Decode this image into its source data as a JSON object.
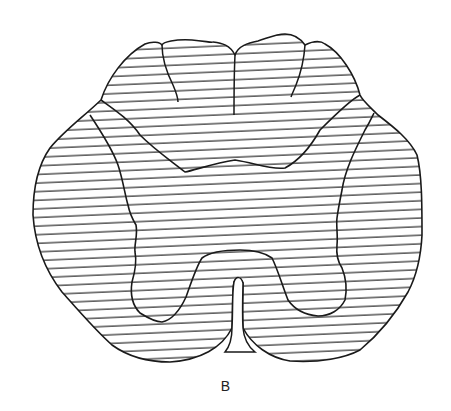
{
  "figure": {
    "label": "B",
    "colors": {
      "stroke": "#1a1a1a",
      "hatch": "#2a2a2a",
      "background": "#ffffff"
    },
    "hatch_spacing_px": 8.6
  }
}
